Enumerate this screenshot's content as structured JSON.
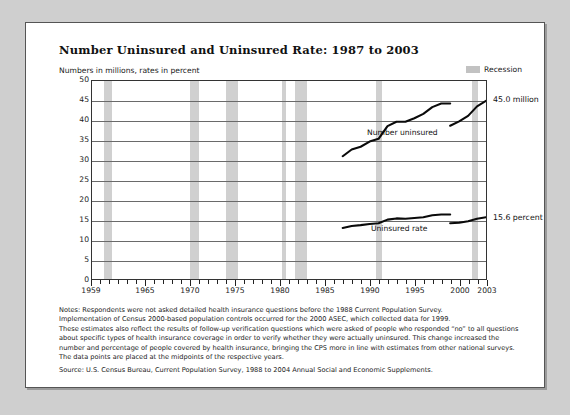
{
  "title": "Number Uninsured and Uninsured Rate:  1987 to 2003",
  "axis_note": "Numbers in millions, rates in percent",
  "legend": {
    "recession_label": "Recession",
    "recession_color": "#c8c8c8"
  },
  "notes": [
    "Notes:  Respondents were not asked detailed health insurance questions before the 1988 Current Population Survey.",
    "Implementation of Census 2000-based population controls occurred for the 2000 ASEC, which collected data for 1999.",
    "These estimates also reflect the results of follow-up verification questions which were asked of people who responded “no” to all questions about specific types of health insurance coverage in order to verify whether they were actually uninsured.  This change increased the number and percentage of people covered by health insurance, bringing the CPS more in line with estimates from other national surveys.",
    "The data points are placed at the midpoints of the respective years."
  ],
  "source": "Source:  U.S. Census Bureau, Current Population Survey, 1988 to 2004 Annual Social and Economic Supplements.",
  "chart_data": {
    "type": "line",
    "title": "Number Uninsured and Uninsured Rate:  1987 to 2003",
    "xlabel": "",
    "ylabel": "Numbers in millions, rates in percent",
    "xlim": [
      1959,
      2003
    ],
    "ylim": [
      0,
      50
    ],
    "yticks": [
      0,
      5,
      10,
      15,
      20,
      25,
      30,
      35,
      40,
      45,
      50
    ],
    "xticks_labeled": [
      1959,
      1965,
      1970,
      1975,
      1980,
      1985,
      1990,
      1995,
      2000,
      2003
    ],
    "grid": "horizontal",
    "legend_position": "top-right",
    "series": [
      {
        "name": "Number uninsured",
        "units": "millions",
        "end_label": "45.0 million",
        "x": [
          1987,
          1988,
          1989,
          1990,
          1991,
          1992,
          1993,
          1994,
          1995,
          1996,
          1997,
          1998,
          1999,
          1999,
          2000,
          2001,
          2002,
          2003
        ],
        "values": [
          31.0,
          32.7,
          33.4,
          34.7,
          35.4,
          38.6,
          39.7,
          39.7,
          40.6,
          41.7,
          43.4,
          44.3,
          44.3,
          38.7,
          39.8,
          41.2,
          43.6,
          45.0
        ]
      },
      {
        "name": "Uninsured rate",
        "units": "percent",
        "end_label": "15.6 percent",
        "x": [
          1987,
          1988,
          1989,
          1990,
          1991,
          1992,
          1993,
          1994,
          1995,
          1996,
          1997,
          1998,
          1999,
          1999,
          2000,
          2001,
          2002,
          2003
        ],
        "values": [
          12.9,
          13.4,
          13.6,
          13.9,
          14.1,
          15.0,
          15.3,
          15.2,
          15.4,
          15.6,
          16.1,
          16.3,
          16.3,
          14.1,
          14.2,
          14.6,
          15.2,
          15.6
        ]
      }
    ],
    "annotations": [
      {
        "text": "Number uninsured",
        "x": 1993,
        "y": 37
      },
      {
        "text": "Uninsured rate",
        "x": 1993,
        "y": 13
      },
      {
        "text": "45.0 million",
        "x": 2003,
        "y": 45.0
      },
      {
        "text": "15.6 percent",
        "x": 2003,
        "y": 15.6
      }
    ],
    "recessions": [
      {
        "start": 1960.3,
        "end": 1961.2
      },
      {
        "start": 1969.9,
        "end": 1970.9
      },
      {
        "start": 1973.9,
        "end": 1975.2
      },
      {
        "start": 1980.1,
        "end": 1980.6
      },
      {
        "start": 1981.5,
        "end": 1982.9
      },
      {
        "start": 1990.6,
        "end": 1991.2
      },
      {
        "start": 2001.2,
        "end": 2001.9
      }
    ]
  }
}
